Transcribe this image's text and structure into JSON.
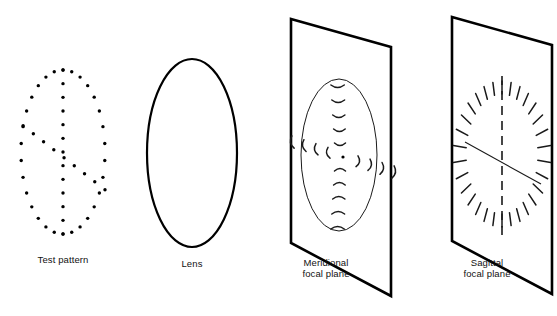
{
  "figure": {
    "background_color": "#ffffff",
    "ink_color": "#000000"
  },
  "panels": [
    {
      "id": "test-pattern",
      "caption_lines": [
        "Test pattern"
      ],
      "caption_x": 63,
      "caption_y": 263,
      "type": "dot-array",
      "center": {
        "x": 63,
        "y": 152
      },
      "ellipse": {
        "rx": 42,
        "ry": 82
      },
      "dot_radius": 1.7,
      "ring_count": 30,
      "vertical_count": 13,
      "diagonal_count": 9
    },
    {
      "id": "lens",
      "caption_lines": [
        "Lens"
      ],
      "caption_x": 192,
      "caption_y": 267,
      "type": "lens",
      "center": {
        "x": 192,
        "y": 153
      },
      "ellipse": {
        "rx": 45,
        "ry": 94
      }
    },
    {
      "id": "meridional-focal-plane",
      "caption_lines": [
        "Meridional",
        "focal plane"
      ],
      "caption_x": 326,
      "caption_y": 266,
      "type": "plane-with-arcs",
      "plane_corners": [
        {
          "x": 291,
          "y": 19
        },
        {
          "x": 391,
          "y": 47
        },
        {
          "x": 391,
          "y": 296
        },
        {
          "x": 291,
          "y": 243
        }
      ],
      "blur_ellipse": {
        "cx": 339,
        "cy": 155,
        "rx": 38,
        "ry": 76
      },
      "center_dot": {
        "cx": 343,
        "cy": 157,
        "r": 1.6
      },
      "mark_style": "tangential-arc"
    },
    {
      "id": "sagittal-focal-plane",
      "caption_lines": [
        "Sagittal",
        "focal plane"
      ],
      "caption_x": 487,
      "caption_y": 266,
      "type": "plane-with-dashes",
      "plane_corners": [
        {
          "x": 452,
          "y": 17
        },
        {
          "x": 552,
          "y": 45
        },
        {
          "x": 552,
          "y": 294
        },
        {
          "x": 452,
          "y": 241
        }
      ],
      "blur_ellipse": {
        "cx": 502,
        "cy": 154,
        "rx": 45,
        "ry": 75
      },
      "axis_vertical": {
        "x": 502,
        "y1": 76,
        "y2": 238
      },
      "axis_diagonal": {
        "x1": 465,
        "y1": 142,
        "x2": 541,
        "y2": 184
      },
      "mark_style": "radial-dash",
      "dash_count": 30
    }
  ],
  "captions": {
    "test_pattern": "Test pattern",
    "lens": "Lens",
    "meridional_line1": "Meridional",
    "meridional_line2": "focal plane",
    "sagittal_line1": "Sagittal",
    "sagittal_line2": "focal plane"
  }
}
